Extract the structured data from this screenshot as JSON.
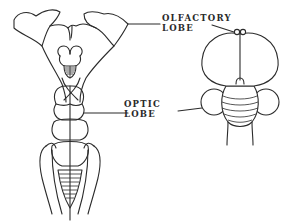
{
  "figure": {
    "type": "anatomical line drawing",
    "views": [
      {
        "id": "left-view",
        "description": "elongated brain, dorsal view, stippled olfactory lobes at top"
      },
      {
        "id": "right-view",
        "description": "rounded brain, large hemispheres with small olfactory lobes on top, optic lobes at sides"
      }
    ],
    "labels": {
      "olfactory": {
        "line1": "OLFACTORY",
        "line2": "LOBE"
      },
      "optic": {
        "line1": "OPTIC",
        "line2": "LOBE"
      }
    },
    "colors": {
      "ink": "#2b2b2b",
      "background": "#ffffff"
    }
  }
}
